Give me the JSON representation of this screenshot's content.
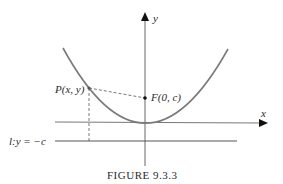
{
  "figure": {
    "caption": "Figure 9.3.3",
    "caption_display": "FIGURE 9.3.3"
  },
  "axes": {
    "x_label": "x",
    "y_label": "y"
  },
  "points": {
    "P": {
      "label": "P(x, y)"
    },
    "F": {
      "label": "F(0, c)"
    }
  },
  "directrix": {
    "label": "l:y = −c"
  },
  "colors": {
    "curve": "#7a7a7a",
    "axis": "#555555",
    "text": "#2a2a2a",
    "background": "#ffffff"
  }
}
